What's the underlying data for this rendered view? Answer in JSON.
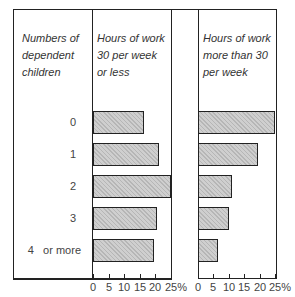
{
  "chart_data": {
    "type": "bar",
    "orientation": "horizontal",
    "title": "",
    "categories_label": "Numbers of dependent children",
    "categories": [
      "0",
      "1",
      "2",
      "3",
      "4   or more"
    ],
    "series": [
      {
        "name": "Hours of work 30 per week or less",
        "values": [
          16.5,
          21,
          25,
          20.5,
          19.5
        ]
      },
      {
        "name": "Hours of work more than 30 per week",
        "values": [
          25,
          19.5,
          11,
          10,
          6.5
        ]
      }
    ],
    "xlabel": "%",
    "xlim": [
      0,
      25
    ],
    "xticks": [
      "0",
      "5",
      "10",
      "15",
      "20",
      "25%"
    ],
    "grid": false,
    "legend": "panel headers"
  },
  "headers": {
    "categories": [
      "Numbers of",
      "dependent",
      "children"
    ],
    "left": [
      "Hours of work",
      "30 per week",
      "or less"
    ],
    "right": [
      "Hours of work",
      "more than 30",
      "per week"
    ]
  },
  "ticks": [
    "0",
    "5",
    "10",
    "15",
    "20",
    "25%"
  ]
}
